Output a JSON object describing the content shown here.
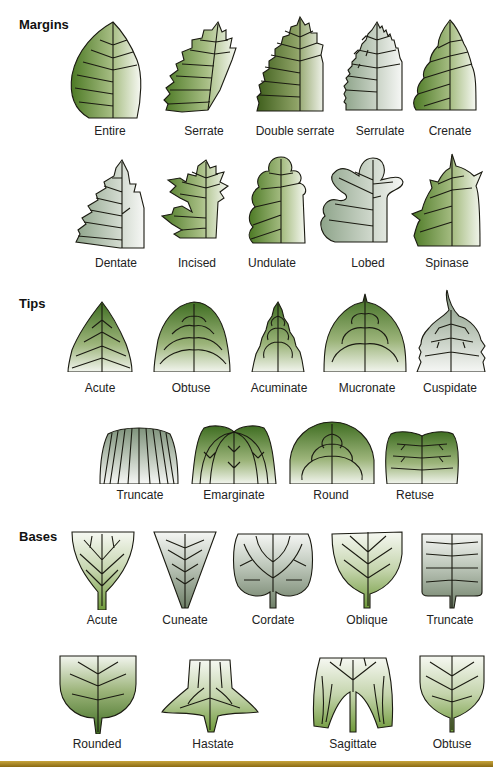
{
  "sections": {
    "margins": {
      "title": "Margins",
      "items": [
        {
          "label": "Entire"
        },
        {
          "label": "Serrate"
        },
        {
          "label": "Double serrate"
        },
        {
          "label": "Serrulate"
        },
        {
          "label": "Crenate"
        },
        {
          "label": "Dentate"
        },
        {
          "label": "Incised"
        },
        {
          "label": "Undulate"
        },
        {
          "label": "Lobed"
        },
        {
          "label": "Spinase"
        }
      ]
    },
    "tips": {
      "title": "Tips",
      "items": [
        {
          "label": "Acute"
        },
        {
          "label": "Obtuse"
        },
        {
          "label": "Acuminate"
        },
        {
          "label": "Mucronate"
        },
        {
          "label": "Cuspidate"
        },
        {
          "label": "Truncate"
        },
        {
          "label": "Emarginate"
        },
        {
          "label": "Round"
        },
        {
          "label": "Retuse"
        }
      ]
    },
    "bases": {
      "title": "Bases",
      "items": [
        {
          "label": "Acute"
        },
        {
          "label": "Cuneate"
        },
        {
          "label": "Cordate"
        },
        {
          "label": "Oblique"
        },
        {
          "label": "Truncate"
        },
        {
          "label": "Rounded"
        },
        {
          "label": "Hastate"
        },
        {
          "label": "Sagittate"
        },
        {
          "label": "Obtuse"
        }
      ]
    }
  },
  "colors": {
    "leaf_dark": "#4f7a2a",
    "leaf_mid": "#7fa04a",
    "leaf_light": "#f3f6ee",
    "vein": "#1b1b12",
    "bottom_bar": "#b8952c"
  }
}
